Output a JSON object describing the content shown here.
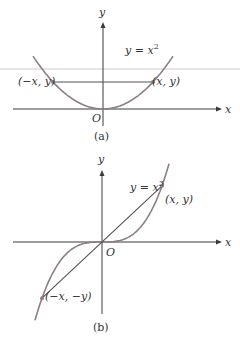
{
  "figure_a": {
    "caption": "(a)",
    "equation": "y = x",
    "exponent": "2",
    "axis_x_label": "x",
    "axis_y_label": "y",
    "origin_label": "O",
    "point_left_label": "(−x,  y)",
    "point_right_label": "(x,  y)",
    "geometry": {
      "origin": [
        103,
        109
      ],
      "x_axis": [
        13,
        222
      ],
      "y_axis": [
        22,
        126
      ],
      "curve_scale": 0.0108,
      "curve_x_half": 70,
      "point_x_half": 50
    }
  },
  "figure_b": {
    "caption": "(b)",
    "equation": "y = x",
    "exponent": "3",
    "axis_x_label": "x",
    "axis_y_label": "y",
    "origin_label": "O",
    "point_left_label": "(−x,  −y)",
    "point_right_label": "(x,  y)",
    "geometry": {
      "origin": [
        102,
        242
      ],
      "x_axis": [
        13,
        222
      ],
      "y_axis": [
        170,
        314
      ],
      "curve_scale": 0.00026,
      "curve_x_half": 67,
      "point_x_half": 60
    }
  },
  "colors": {
    "curve": "#8c7f84",
    "axis": "#3a3a3a",
    "chord": "#555050"
  }
}
